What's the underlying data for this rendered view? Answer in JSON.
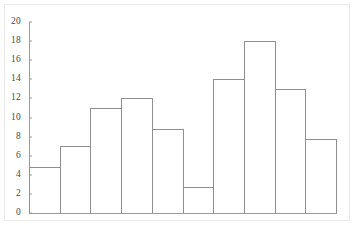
{
  "chart_data": {
    "type": "bar",
    "title": "",
    "subtitle": "",
    "xlabel": "",
    "ylabel": "",
    "categories": [
      "1",
      "2",
      "3",
      "4",
      "5",
      "6",
      "7",
      "8",
      "9",
      "10"
    ],
    "values": [
      4.8,
      7.0,
      11.0,
      12.0,
      8.8,
      2.7,
      14.0,
      18.0,
      13.0,
      7.7
    ],
    "series": [
      {
        "name": "frequency",
        "values": [
          4.8,
          7.0,
          11.0,
          12.0,
          8.8,
          2.7,
          14.0,
          18.0,
          13.0,
          7.7
        ]
      }
    ],
    "ylim": [
      0,
      20
    ],
    "xlim": [
      0,
      10
    ],
    "ytick_labels": [
      "0",
      "2",
      "4",
      "6",
      "8",
      "10",
      "12",
      "14",
      "16",
      "18",
      "20"
    ],
    "ytick_values": [
      0,
      2,
      4,
      6,
      8,
      10,
      12,
      14,
      16,
      18,
      20
    ],
    "xtick_labels": [],
    "grid": false,
    "legend": [],
    "legend_position": "none",
    "annotations": [],
    "bar_fill_color": "#ffffff",
    "bar_edge_color": "#8f8f8f",
    "axis_color": "#9a9a9a",
    "tick_label_color": "#4a4a4a",
    "background_color": "#ffffff",
    "border_color": "#e9e9e9"
  }
}
